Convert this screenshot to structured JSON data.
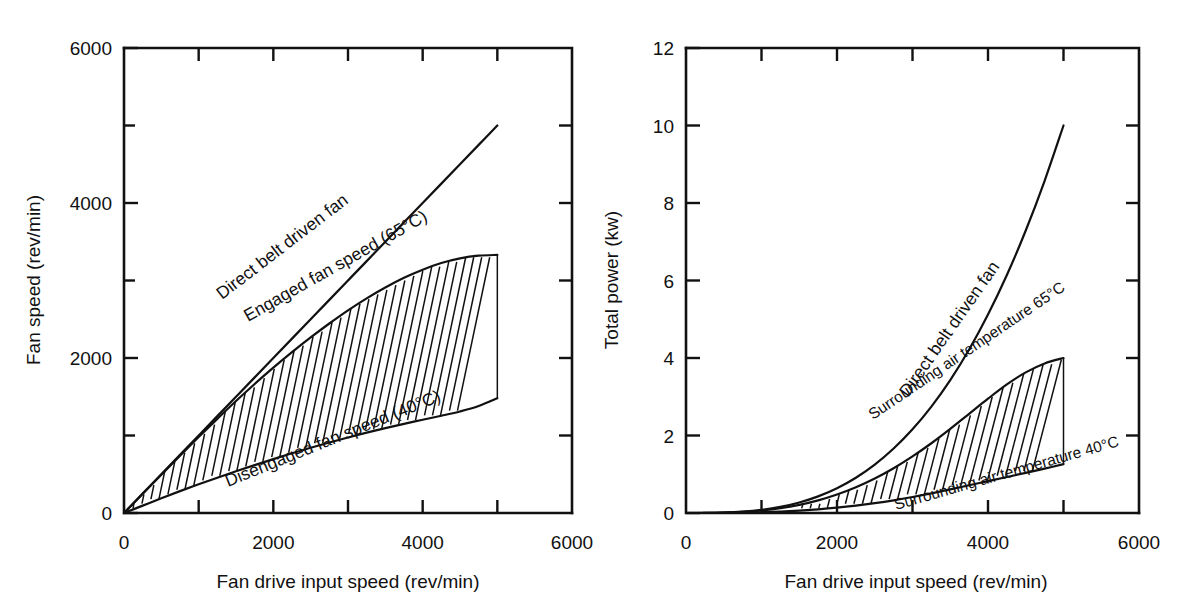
{
  "figure": {
    "background_color": "#ffffff",
    "ink_color": "#111111",
    "panel_count": 2
  },
  "chart_data": [
    {
      "type": "line",
      "id": "fan-speed-chart",
      "title": "",
      "xlabel": "Fan drive input speed (rev/min)",
      "ylabel": "Fan speed (rev/min)",
      "xlim": [
        0,
        6000
      ],
      "ylim": [
        0,
        6000
      ],
      "grid": false,
      "legend": "inline-curve-labels",
      "x_major_ticks": [
        0,
        2000,
        4000,
        6000
      ],
      "x_minor_ticks": [
        1000,
        3000,
        5000
      ],
      "x_ticklabels": [
        "0",
        "2000",
        "4000",
        "6000"
      ],
      "y_major_ticks": [
        0,
        2000,
        4000,
        6000
      ],
      "y_minor_ticks": [
        1000,
        3000,
        5000
      ],
      "y_ticklabels": [
        "0",
        "2000",
        "4000",
        "6000"
      ],
      "shaded_region": {
        "style": "hatched",
        "between": [
          "Engaged fan speed (65°C)",
          "Disengaged fan speed (40°C)"
        ],
        "x_range": [
          0,
          5000
        ]
      },
      "x": [
        0,
        250,
        500,
        750,
        1000,
        1250,
        1500,
        1750,
        2000,
        2250,
        2500,
        2750,
        3000,
        3250,
        3500,
        3750,
        4000,
        4250,
        4500,
        4750,
        5000
      ],
      "series": [
        {
          "name": "Direct belt driven fan",
          "label": "Direct belt driven fan",
          "values": [
            0,
            250,
            500,
            750,
            1000,
            1250,
            1500,
            1750,
            2000,
            2250,
            2500,
            2750,
            3000,
            3250,
            3500,
            3750,
            4000,
            4250,
            4500,
            4750,
            5000
          ]
        },
        {
          "name": "Engaged fan speed",
          "label": "Engaged fan speed (65°C)",
          "values": [
            0,
            248,
            495,
            740,
            980,
            1215,
            1445,
            1665,
            1875,
            2075,
            2265,
            2445,
            2615,
            2770,
            2910,
            3035,
            3140,
            3225,
            3285,
            3320,
            3330
          ]
        },
        {
          "name": "Disengaged fan speed",
          "label": "Disengaged fan speed (40°C)",
          "values": [
            0,
            95,
            190,
            282,
            370,
            455,
            538,
            618,
            695,
            770,
            842,
            910,
            975,
            1037,
            1095,
            1150,
            1203,
            1255,
            1310,
            1380,
            1480
          ]
        }
      ]
    },
    {
      "type": "line",
      "id": "total-power-chart",
      "title": "",
      "xlabel": "Fan drive input speed (rev/min)",
      "ylabel": "Total power (kw)",
      "xlim": [
        0,
        6000
      ],
      "ylim": [
        0,
        12
      ],
      "grid": false,
      "legend": "inline-curve-labels",
      "x_major_ticks": [
        0,
        2000,
        4000,
        6000
      ],
      "x_minor_ticks": [
        1000,
        3000,
        5000
      ],
      "x_ticklabels": [
        "0",
        "2000",
        "4000",
        "6000"
      ],
      "y_major_ticks": [
        0,
        2,
        4,
        6,
        8,
        10,
        12
      ],
      "y_minor_ticks": [],
      "y_ticklabels": [
        "0",
        "2",
        "4",
        "6",
        "8",
        "10",
        "12"
      ],
      "shaded_region": {
        "style": "hatched",
        "between": [
          "Surrounding air temperature 65°C",
          "Surrounding air temperature 40°C"
        ],
        "x_range": [
          0,
          5000
        ]
      },
      "x": [
        0,
        250,
        500,
        750,
        1000,
        1250,
        1500,
        1750,
        2000,
        2250,
        2500,
        2750,
        3000,
        3250,
        3500,
        3750,
        4000,
        4250,
        4500,
        4750,
        5000
      ],
      "series": [
        {
          "name": "Direct belt driven fan",
          "label": "Direct belt driven fan",
          "values": [
            0,
            0.0013,
            0.01,
            0.034,
            0.08,
            0.156,
            0.27,
            0.429,
            0.64,
            0.911,
            1.25,
            1.664,
            2.16,
            2.746,
            3.43,
            4.219,
            5.12,
            6.141,
            7.29,
            8.574,
            10.0
          ]
        },
        {
          "name": "Surrounding air temperature 65C",
          "label": "Surrounding air temperature 65°C",
          "values": [
            0,
            0.001,
            0.008,
            0.028,
            0.064,
            0.122,
            0.208,
            0.325,
            0.476,
            0.664,
            0.89,
            1.155,
            1.46,
            1.8,
            2.17,
            2.56,
            2.95,
            3.32,
            3.63,
            3.86,
            4.0
          ]
        },
        {
          "name": "Surrounding air temperature 40C",
          "label": "Surrounding air temperature 40°C",
          "values": [
            0,
            0.0004,
            0.003,
            0.009,
            0.02,
            0.037,
            0.062,
            0.095,
            0.137,
            0.19,
            0.253,
            0.327,
            0.412,
            0.506,
            0.608,
            0.715,
            0.823,
            0.93,
            1.035,
            1.145,
            1.26
          ]
        }
      ]
    }
  ],
  "left_panel": {
    "y_axis_title": "Fan speed  (rev/min)",
    "x_axis_title": "Fan drive input speed (rev/min)",
    "y_ticklabels": [
      "6000",
      "4000",
      "2000",
      "0"
    ],
    "x_ticklabels": [
      "0",
      "2000",
      "4000",
      "6000"
    ],
    "curve_labels": {
      "direct": "Direct belt driven fan",
      "engaged": "Engaged fan speed (65°C)",
      "disengaged": "Disengaged fan speed (40°C)"
    }
  },
  "right_panel": {
    "y_axis_title": "Total power (kw)",
    "x_axis_title": "Fan drive input speed (rev/min)",
    "y_ticklabels": [
      "12",
      "10",
      "8",
      "6",
      "4",
      "2",
      "0"
    ],
    "x_ticklabels": [
      "0",
      "2000",
      "4000",
      "6000"
    ],
    "curve_labels": {
      "direct": "Direct belt driven fan",
      "hot": "Surrounding air temperature 65°C",
      "cold": "Surrounding air temperature 40°C"
    }
  }
}
